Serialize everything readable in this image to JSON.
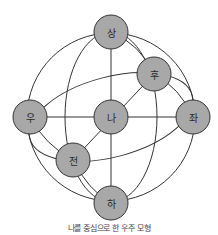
{
  "diagram": {
    "title": "나를 중심으로 한 우주 모형",
    "colors": {
      "node_fill": "#a8a8a8",
      "stroke": "#333333",
      "background": "#ffffff"
    },
    "nodes": {
      "top": {
        "label": "상",
        "meaning": "up"
      },
      "back": {
        "label": "후",
        "meaning": "back"
      },
      "right": {
        "label": "우",
        "meaning": "right"
      },
      "center": {
        "label": "나",
        "meaning": "me"
      },
      "left": {
        "label": "좌",
        "meaning": "left"
      },
      "front": {
        "label": "전",
        "meaning": "front"
      },
      "bottom": {
        "label": "하",
        "meaning": "down"
      }
    },
    "edges": [
      [
        "우",
        "나"
      ],
      [
        "나",
        "좌"
      ],
      [
        "상",
        "나"
      ],
      [
        "나",
        "하"
      ],
      [
        "후",
        "나"
      ],
      [
        "나",
        "전"
      ]
    ],
    "caption": "나를 중심으로 한 우주 모형"
  }
}
